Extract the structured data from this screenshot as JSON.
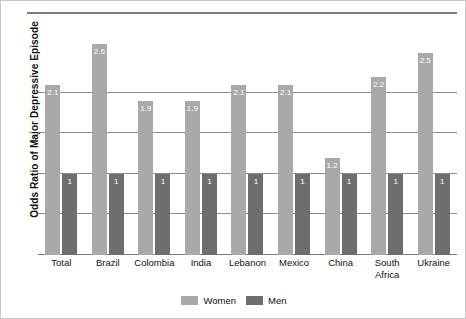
{
  "chart_data": {
    "type": "bar",
    "title": "",
    "xlabel": "",
    "ylabel": "Odds Ratio of Major Depressive Episode",
    "categories": [
      "Total",
      "Brazil",
      "Colombia",
      "India",
      "Lebanon",
      "Mexico",
      "China",
      "South\nAfrica",
      "Ukraine"
    ],
    "series": [
      {
        "name": "Women",
        "color": "#a9a9a9",
        "values": [
          2.1,
          2.6,
          1.9,
          1.9,
          2.1,
          2.1,
          1.2,
          2.2,
          2.5
        ],
        "labels": [
          "2.1",
          "2.6",
          "1.9",
          "1.9",
          "2.1",
          "2.1",
          "1.2",
          "2.2",
          "2.5"
        ]
      },
      {
        "name": "Men",
        "color": "#6e6e6e",
        "values": [
          1,
          1,
          1,
          1,
          1,
          1,
          1,
          1,
          1
        ],
        "labels": [
          "1",
          "1",
          "1",
          "1",
          "1",
          "1",
          "1",
          "1",
          "1"
        ]
      }
    ],
    "ylim": [
      0,
      3.0
    ],
    "yticks": [
      0,
      0.5,
      1.0,
      1.5,
      2.0,
      2.5,
      3.0
    ],
    "grid": true,
    "legend_position": "bottom"
  },
  "legend": {
    "entries": [
      {
        "label": "Women",
        "color": "#a9a9a9"
      },
      {
        "label": "Men",
        "color": "#6e6e6e"
      }
    ]
  }
}
